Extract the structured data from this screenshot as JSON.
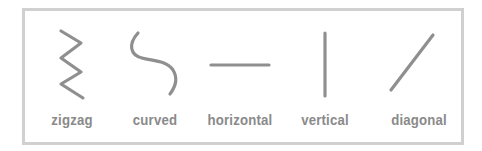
{
  "figure": {
    "border_color": "#d0d0d0",
    "stroke_color": "#8f8f8f",
    "label_color": "#8a8a8a",
    "items": [
      {
        "label": "zigzag",
        "icon": "zigzag-line-icon"
      },
      {
        "label": "curved",
        "icon": "curved-line-icon"
      },
      {
        "label": "horizontal",
        "icon": "horizontal-line-icon"
      },
      {
        "label": "vertical",
        "icon": "vertical-line-icon"
      },
      {
        "label": "diagonal",
        "icon": "diagonal-line-icon"
      }
    ]
  }
}
